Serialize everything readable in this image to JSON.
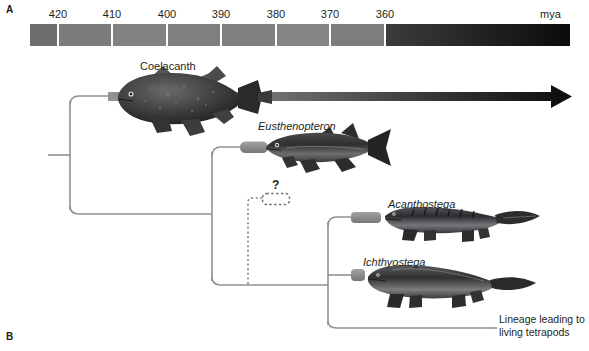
{
  "panels": {
    "a_label": "A",
    "b_label": "B"
  },
  "timescale": {
    "unit_label": "mya",
    "ticks": [
      {
        "value": "420",
        "x": 28
      },
      {
        "value": "410",
        "x": 82
      },
      {
        "value": "400",
        "x": 137
      },
      {
        "value": "390",
        "x": 191
      },
      {
        "value": "380",
        "x": 246
      },
      {
        "value": "370",
        "x": 300
      },
      {
        "value": "360",
        "x": 355
      }
    ],
    "segments": [
      {
        "x": 0,
        "w": 28,
        "color": "#6e6e6e"
      },
      {
        "x": 28,
        "w": 54,
        "color": "#7c7c7c"
      },
      {
        "x": 82,
        "w": 55,
        "color": "#828282"
      },
      {
        "x": 137,
        "w": 54,
        "color": "#7f7f7f"
      },
      {
        "x": 191,
        "w": 55,
        "color": "#808080"
      },
      {
        "x": 246,
        "w": 54,
        "color": "#858585"
      },
      {
        "x": 300,
        "w": 55,
        "color": "#7d7d7d"
      }
    ],
    "tail": {
      "x": 355,
      "w": 185,
      "from_color": "#3c3c3c",
      "to_color": "#0b0b0b"
    }
  },
  "tree": {
    "accent_color": "#8c8c8c",
    "branch_color": "#8f9193",
    "taxa": [
      {
        "name": "Coelacanth",
        "italic": false,
        "label_x": 140,
        "label_y": 60
      },
      {
        "name": "Eusthenopteron",
        "italic": true,
        "label_x": 258,
        "label_y": 120
      },
      {
        "name": "Acanthostega",
        "italic": true,
        "label_x": 388,
        "label_y": 198
      },
      {
        "name": "Ichthyostega",
        "italic": true,
        "label_x": 363,
        "label_y": 256
      }
    ],
    "uncertain_marker": "?",
    "lineage_note": "Lineage leading to living tetrapods"
  }
}
